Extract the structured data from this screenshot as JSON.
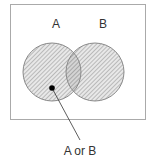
{
  "diagram": {
    "type": "venn",
    "sets": [
      {
        "label": "A",
        "cx": 52,
        "cy": 72,
        "r": 29
      },
      {
        "label": "B",
        "cx": 95,
        "cy": 72,
        "r": 29
      }
    ],
    "annotation": "A or B",
    "colors": {
      "frame": "#aaaaaa",
      "circle_stroke": "#888888",
      "hatch": "#999999",
      "fill": "#e6e6e6",
      "text": "#333333",
      "dot": "#000000"
    }
  }
}
